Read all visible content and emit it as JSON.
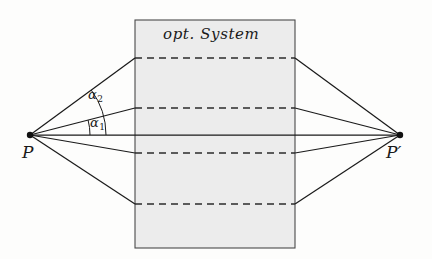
{
  "figure": {
    "kind": "optical-system-ray-diagram",
    "background_color": "#fdfdfc",
    "stroke_color": "#1a1a1a",
    "box": {
      "label": "opt. System",
      "fill_color": "#ececec",
      "border_color": "#4a4a4a",
      "left": 135,
      "right": 295,
      "top": 20,
      "bottom": 248
    },
    "points": [
      {
        "id": "object",
        "label": "P",
        "x": 30,
        "y": 135
      },
      {
        "id": "image",
        "label": "P′",
        "x": 400,
        "y": 135
      }
    ],
    "axis": {
      "y": 135,
      "from_x": 30,
      "to_x": 400
    },
    "dashed_lines": [
      {
        "y": 58
      },
      {
        "y": 108
      },
      {
        "y": 153
      },
      {
        "y": 204
      }
    ],
    "rays": [
      {
        "id": "ray-upper-outer",
        "entry_y": 58
      },
      {
        "id": "ray-upper-inner",
        "entry_y": 108
      },
      {
        "id": "ray-axis",
        "entry_y": 135
      },
      {
        "id": "ray-lower-inner",
        "entry_y": 153
      },
      {
        "id": "ray-lower-outer",
        "entry_y": 204
      }
    ],
    "angles": [
      {
        "id": "alpha2",
        "symbol": "α",
        "subscript": "2",
        "label_x": 88,
        "label_y": 88,
        "arc_radius": 76,
        "between": [
          "ray-axis",
          "ray-upper-outer"
        ]
      },
      {
        "id": "alpha1",
        "symbol": "α",
        "subscript": "1",
        "label_x": 90,
        "label_y": 116,
        "arc_radius": 60,
        "between": [
          "ray-axis",
          "ray-upper-inner"
        ]
      }
    ]
  }
}
